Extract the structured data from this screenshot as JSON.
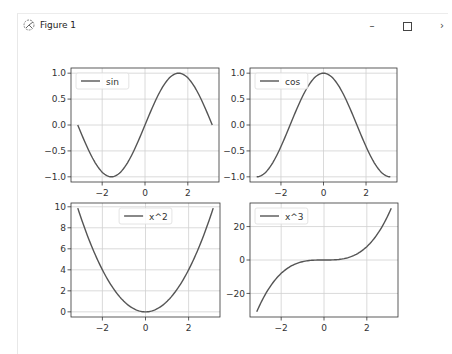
{
  "window": {
    "title": "Figure 1",
    "controls": {
      "minimize": "–",
      "maximize": "□",
      "close": "›"
    }
  },
  "colors": {
    "line": "#555555",
    "grid": "#d0d0d0",
    "axes": "#333333",
    "legend_border": "#dddddd"
  },
  "chart_data": [
    {
      "type": "line",
      "legend": [
        "sin"
      ],
      "legend_position": "upper left",
      "function": "sin",
      "x_range": [
        -3.14159,
        3.14159
      ],
      "xlim": [
        -3.456,
        3.456
      ],
      "ylim": [
        -1.1,
        1.1
      ],
      "xticks": [
        -2,
        0,
        2
      ],
      "xtick_labels": [
        "−2",
        "0",
        "2"
      ],
      "yticks": [
        -1.0,
        -0.5,
        0.0,
        0.5,
        1.0
      ],
      "ytick_labels": [
        "−1.0",
        "−0.5",
        "0.0",
        "0.5",
        "1.0"
      ],
      "grid": true,
      "box": [
        71,
        68,
        219,
        182
      ]
    },
    {
      "type": "line",
      "legend": [
        "cos"
      ],
      "legend_position": "upper left",
      "function": "cos",
      "x_range": [
        -3.14159,
        3.14159
      ],
      "xlim": [
        -3.456,
        3.456
      ],
      "ylim": [
        -1.1,
        1.1
      ],
      "xticks": [
        -2,
        0,
        2
      ],
      "xtick_labels": [
        "−2",
        "0",
        "2"
      ],
      "yticks": [
        -1.0,
        -0.5,
        0.0,
        0.5,
        1.0
      ],
      "ytick_labels": [
        "−1.0",
        "−0.5",
        "0.0",
        "0.5",
        "1.0"
      ],
      "grid": true,
      "box": [
        250,
        68,
        397,
        182
      ]
    },
    {
      "type": "line",
      "legend": [
        "x^2"
      ],
      "legend_position": "upper center",
      "function": "x^2",
      "x_range": [
        -3.14159,
        3.14159
      ],
      "xlim": [
        -3.456,
        3.456
      ],
      "ylim": [
        -0.49,
        10.36
      ],
      "xticks": [
        -2,
        0,
        2
      ],
      "xtick_labels": [
        "−2",
        "0",
        "2"
      ],
      "yticks": [
        0,
        2,
        4,
        6,
        8,
        10
      ],
      "ytick_labels": [
        "0",
        "2",
        "4",
        "6",
        "8",
        "10"
      ],
      "grid": true,
      "box": [
        71,
        203,
        220,
        317
      ]
    },
    {
      "type": "line",
      "legend": [
        "x^3"
      ],
      "legend_position": "upper left",
      "function": "x^3",
      "x_range": [
        -3.14159,
        3.14159
      ],
      "xlim": [
        -3.456,
        3.456
      ],
      "ylim": [
        -34.1,
        34.1
      ],
      "xticks": [
        -2,
        0,
        2
      ],
      "xtick_labels": [
        "−2",
        "0",
        "2"
      ],
      "yticks": [
        -20,
        0,
        20
      ],
      "ytick_labels": [
        "−20",
        "0",
        "20"
      ],
      "grid": true,
      "box": [
        250,
        203,
        398,
        317
      ]
    }
  ]
}
